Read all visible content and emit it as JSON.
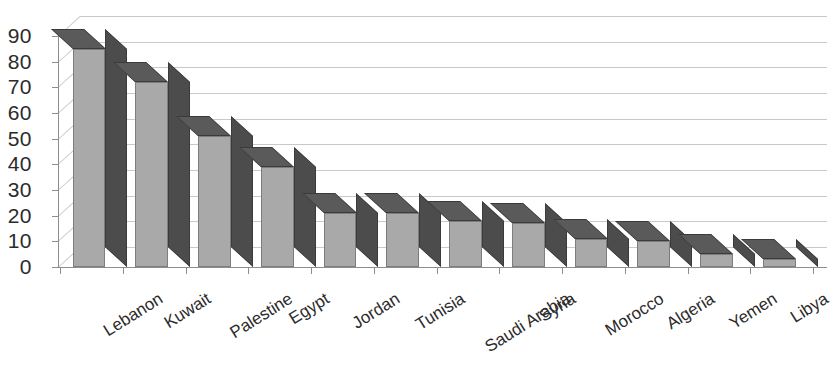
{
  "chart_data": {
    "type": "bar",
    "title": "",
    "subtitle": "",
    "xlabel": "",
    "ylabel": "",
    "categories": [
      "Lebanon",
      "Kuwait",
      "Palestine",
      "Egypt",
      "Jordan",
      "Tunisia",
      "Saudi Arabia",
      "Syria",
      "Morocco",
      "Algeria",
      "Yemen",
      "Libya"
    ],
    "values": [
      85,
      72,
      51,
      39,
      21,
      21,
      18,
      17,
      11,
      10,
      5,
      3
    ],
    "series": [
      {
        "name": "",
        "values": [
          85,
          72,
          51,
          39,
          21,
          21,
          18,
          17,
          11,
          10,
          5,
          3
        ]
      }
    ],
    "ylim": [
      0,
      90
    ],
    "ytick_labels": [
      "90",
      "80",
      "70",
      "60",
      "50",
      "40",
      "30",
      "20",
      "10",
      "0"
    ],
    "ytick_values": [
      90,
      80,
      70,
      60,
      50,
      40,
      30,
      20,
      10,
      0
    ],
    "grid": true,
    "grid_axis": "y",
    "legend": false,
    "legend_position": "none",
    "style_3d": true,
    "bar_face_color": "#a9a9a9",
    "bar_side_color": "#4c4c4c",
    "bar_top_color": "#5a5a5a",
    "gridline_color": "#c9c9c9",
    "axis_color": "#8d8d8d",
    "text_color": "#2b2b2b",
    "background_color": "#ffffff",
    "xlabel_rotation_deg": -32
  }
}
